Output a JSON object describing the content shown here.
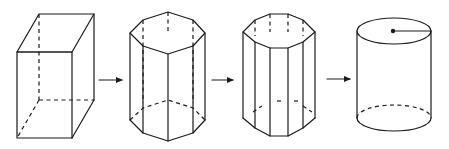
{
  "diagram": {
    "description": "Progression of prisms approaching a cylinder",
    "stroke_color": "#1a1a1a",
    "background": "#ffffff",
    "figures": [
      {
        "id": "rectangular-prism",
        "shape": "rectangular prism",
        "sides": 4
      },
      {
        "id": "octagonal-prism",
        "shape": "octagonal prism",
        "sides": 8
      },
      {
        "id": "decagonal-prism",
        "shape": "decagonal prism",
        "sides": 10
      },
      {
        "id": "cylinder",
        "shape": "cylinder",
        "annotation": "radius line from center dot on top face"
      }
    ],
    "arrows": [
      {
        "from": "rectangular-prism",
        "to": "octagonal-prism"
      },
      {
        "from": "octagonal-prism",
        "to": "decagonal-prism"
      },
      {
        "from": "decagonal-prism",
        "to": "cylinder"
      }
    ]
  }
}
